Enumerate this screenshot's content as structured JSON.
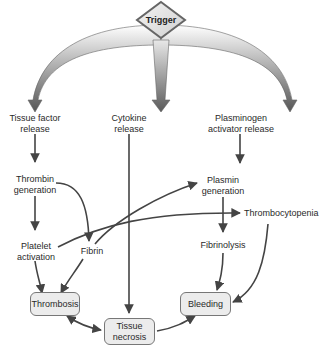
{
  "diagram": {
    "trigger": "Trigger",
    "nodes": {
      "tissue_factor": "Tissue factor\nrelease",
      "cytokine": "Cytokine\nrelease",
      "plasminogen": "Plasminogen\nactivator release",
      "thrombin": "Thrombin\ngeneration",
      "plasmin": "Plasmin\ngeneration",
      "thrombocytopenia": "Thrombocytopenia",
      "platelet": "Platelet\nactivation",
      "fibrin": "Fibrin",
      "fibrinolysis": "Fibrinolysis",
      "thrombosis": "Thrombosis",
      "bleeding": "Bleeding",
      "necrosis": "Tissue\nnecrosis"
    },
    "colors": {
      "arrow": "#444444",
      "box_fill": "#ececec",
      "box_border": "#777777",
      "text": "#2a2a2a"
    }
  }
}
